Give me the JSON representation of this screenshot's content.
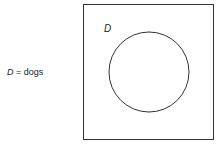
{
  "legend": {
    "symbol": "D",
    "equals": " = ",
    "meaning": "dogs"
  },
  "diagram": {
    "type": "venn",
    "universal_set": {
      "x": 83,
      "y": 4,
      "width": 130,
      "height": 136
    },
    "sets": [
      {
        "label": "D",
        "cx": 149,
        "cy": 72,
        "r": 40
      }
    ],
    "stroke_color": "#333333"
  }
}
